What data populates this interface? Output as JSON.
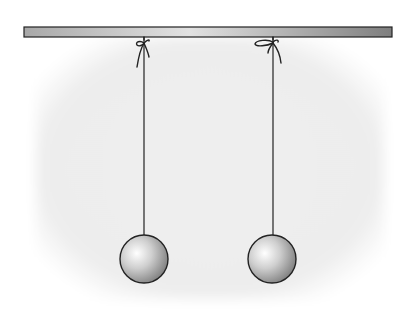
{
  "diagram": {
    "colors": {
      "bar_light": "#d8d8d8",
      "bar_dark": "#8a8a8a",
      "outline": "#222222",
      "background_shade": "#ececec",
      "sphere_highlight": "#ffffff",
      "sphere_shadow": "#8c8c8c"
    },
    "bar": {
      "x": 24,
      "y": 27,
      "width": 368,
      "height": 10
    },
    "pendulums": [
      {
        "id": "left",
        "thread_x": 144,
        "knot_y": 45,
        "ball_cx": 144,
        "ball_cy": 259,
        "ball_r": 24
      },
      {
        "id": "right",
        "thread_x": 273,
        "knot_y": 45,
        "ball_cx": 272,
        "ball_cy": 259,
        "ball_r": 24
      }
    ]
  }
}
